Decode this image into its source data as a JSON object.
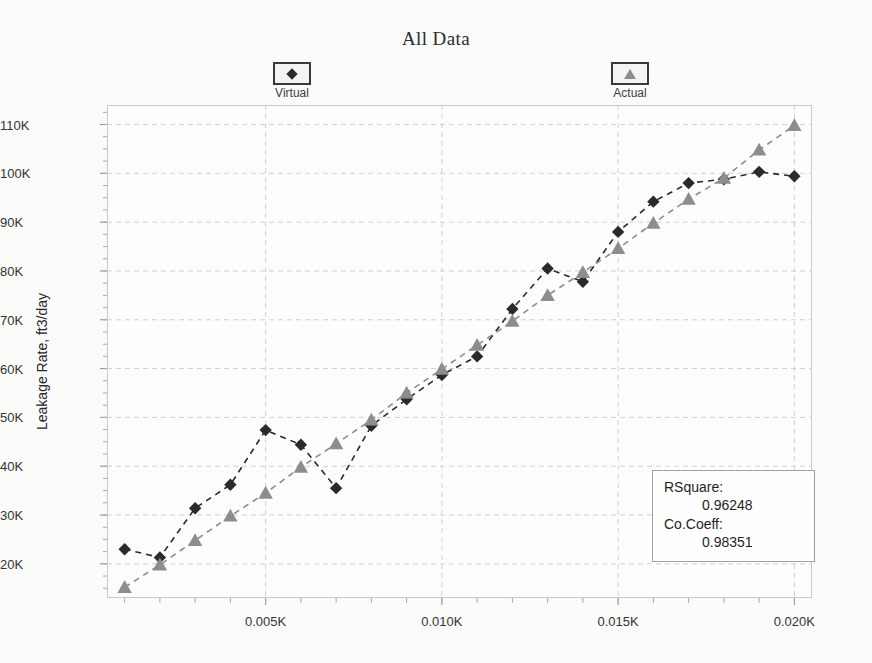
{
  "chart_data": {
    "type": "scatter",
    "title": "All Data",
    "xlabel": "",
    "ylabel": "Leakage Rate, ft3/day",
    "xlim": [
      0.0005,
      0.0205
    ],
    "ylim": [
      13000,
      114000
    ],
    "grid": true,
    "legend_position": "top",
    "x_tick_labels": [
      "0.005K",
      "0.010K",
      "0.015K",
      "0.020K"
    ],
    "x_tick_values": [
      0.005,
      0.01,
      0.015,
      0.02
    ],
    "y_tick_labels": [
      "20K",
      "30K",
      "40K",
      "50K",
      "60K",
      "70K",
      "80K",
      "90K",
      "100K",
      "110K"
    ],
    "y_tick_values": [
      20000,
      30000,
      40000,
      50000,
      60000,
      70000,
      80000,
      90000,
      100000,
      110000
    ],
    "x": [
      0.001,
      0.002,
      0.003,
      0.004,
      0.005,
      0.006,
      0.007,
      0.008,
      0.009,
      0.01,
      0.011,
      0.012,
      0.013,
      0.014,
      0.015,
      0.016,
      0.017,
      0.018,
      0.019,
      0.02
    ],
    "series": [
      {
        "name": "Virtual",
        "marker": "diamond",
        "color": "#2a2a2a",
        "values": [
          23000,
          21300,
          31400,
          36200,
          47400,
          44400,
          35500,
          48300,
          53700,
          58700,
          62500,
          72200,
          80500,
          77800,
          88000,
          94200,
          98000,
          98800,
          100300,
          99400
        ]
      },
      {
        "name": "Actual",
        "marker": "triangle",
        "color": "#8d8d8d",
        "values": [
          15200,
          19800,
          24800,
          29800,
          34500,
          39800,
          44600,
          49500,
          55000,
          59900,
          64800,
          69700,
          75000,
          79700,
          84600,
          89800,
          94700,
          99000,
          104800,
          109800
        ]
      }
    ]
  },
  "legend": [
    {
      "label": "Virtual",
      "marker": "diamond"
    },
    {
      "label": "Actual",
      "marker": "triangle"
    }
  ],
  "stats": {
    "rsquare_key": "RSquare:",
    "rsquare_value": "0.96248",
    "cocoeff_key": "Co.Coeff:",
    "cocoeff_value": "0.98351"
  }
}
